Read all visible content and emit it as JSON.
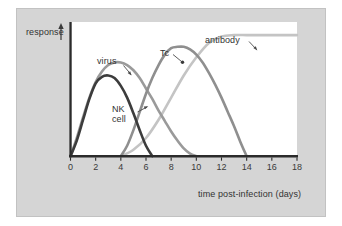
{
  "figure": {
    "background": "#ffffff",
    "panel_color": "#d5d5d5",
    "plot_background": "#ffffff",
    "axis_color": "#2b2b2b"
  },
  "axes": {
    "y_label": "response",
    "y_arrow": "up-arrow-icon",
    "x_label": "time post-infection (days)",
    "x_ticks": [
      "0",
      "2",
      "4",
      "6",
      "8",
      "10",
      "12",
      "14",
      "16",
      "18"
    ]
  },
  "labels": {
    "virus": "virus",
    "nk_cell": "NK cell",
    "tc": "Tc",
    "antibody": "antibody"
  },
  "chart_data": {
    "type": "line",
    "title": "",
    "xlabel": "time post-infection (days)",
    "ylabel": "response",
    "xlim": [
      0,
      18
    ],
    "ylim": [
      0,
      1.0
    ],
    "grid": false,
    "legend": "inline-annotations",
    "x_ticks": [
      0,
      2,
      4,
      6,
      8,
      10,
      12,
      14,
      16,
      18
    ],
    "y_ticks": [],
    "series": [
      {
        "name": "virus",
        "color": "#9a9a9a",
        "peak_day": 4,
        "peak_value": 0.72,
        "returns_to_zero_day": 10,
        "x": [
          0,
          0.5,
          1,
          1.5,
          2,
          2.5,
          3,
          3.5,
          4,
          4.5,
          5,
          5.5,
          6,
          6.5,
          7,
          7.5,
          8,
          8.5,
          9,
          9.5,
          10
        ],
        "values": [
          0,
          0.14,
          0.3,
          0.45,
          0.57,
          0.65,
          0.7,
          0.72,
          0.72,
          0.7,
          0.66,
          0.6,
          0.52,
          0.44,
          0.35,
          0.27,
          0.19,
          0.12,
          0.06,
          0.02,
          0
        ]
      },
      {
        "name": "NK cell",
        "color": "#3c3c3c",
        "peak_day": 3,
        "peak_value": 0.62,
        "returns_to_zero_day": 6.5,
        "x": [
          0,
          0.5,
          1,
          1.5,
          2,
          2.5,
          3,
          3.5,
          4,
          4.5,
          5,
          5.5,
          6,
          6.5
        ],
        "values": [
          0,
          0.12,
          0.28,
          0.44,
          0.56,
          0.61,
          0.62,
          0.6,
          0.54,
          0.45,
          0.33,
          0.2,
          0.08,
          0
        ]
      },
      {
        "name": "Tc",
        "color": "#8f8f8f",
        "peak_day": 8.5,
        "peak_value": 0.84,
        "returns_to_zero_day": 14,
        "x": [
          4,
          4.5,
          5,
          5.5,
          6,
          6.5,
          7,
          7.5,
          8,
          8.5,
          9,
          9.5,
          10,
          10.5,
          11,
          11.5,
          12,
          12.5,
          13,
          13.5,
          14
        ],
        "values": [
          0,
          0.08,
          0.2,
          0.34,
          0.48,
          0.6,
          0.7,
          0.78,
          0.83,
          0.84,
          0.84,
          0.82,
          0.78,
          0.72,
          0.64,
          0.55,
          0.45,
          0.34,
          0.23,
          0.11,
          0
        ]
      },
      {
        "name": "antibody",
        "color": "#c4c4c4",
        "shape": "sigmoid-plateau",
        "plateau_day": 12,
        "plateau_value": 0.93,
        "x": [
          4,
          5,
          6,
          7,
          8,
          9,
          10,
          11,
          12,
          13,
          14,
          15,
          16,
          17,
          18
        ],
        "values": [
          0,
          0.05,
          0.14,
          0.28,
          0.45,
          0.62,
          0.76,
          0.87,
          0.92,
          0.93,
          0.93,
          0.93,
          0.93,
          0.93,
          0.93
        ]
      }
    ],
    "annotations": [
      {
        "text": "virus",
        "points_to_series": "virus",
        "marker": "leader-line"
      },
      {
        "text": "NK cell",
        "points_to_series": "NK cell",
        "marker": "leader-line-dot"
      },
      {
        "text": "Tc",
        "points_to_series": "Tc",
        "marker": "leader-line-dot"
      },
      {
        "text": "antibody",
        "points_to_series": "antibody",
        "marker": "leader-line"
      }
    ]
  }
}
